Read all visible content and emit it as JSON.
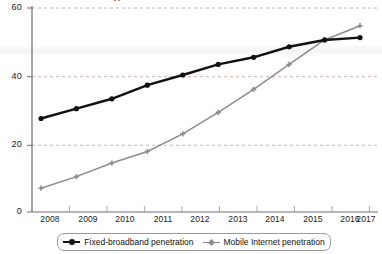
{
  "chart_data": {
    "type": "line",
    "title": "",
    "xlabel": "",
    "ylabel": "",
    "categories": [
      "2008",
      "2009",
      "2010",
      "2011",
      "2012",
      "2013",
      "2014",
      "2015",
      "2016",
      "2017"
    ],
    "x": [
      2008,
      2009,
      2010,
      2011,
      2012,
      2013,
      2014,
      2015,
      2016,
      2017
    ],
    "ylim": [
      0,
      60
    ],
    "xlim": [
      2008,
      2017
    ],
    "yticks": [
      0,
      20,
      40,
      60
    ],
    "ytick_labels": [
      "0",
      "20",
      "40",
      "60"
    ],
    "grid": "horizontal-dashed",
    "legend_position": "bottom-center",
    "series": [
      {
        "name": "Fixed-broadband penetration",
        "color": "#111111",
        "marker": "circle",
        "values": [
          27.5,
          30.4,
          33.3,
          37.3,
          40.3,
          43.4,
          45.5,
          48.6,
          50.6,
          51.3
        ]
      },
      {
        "name": "Mobile Internet penetration",
        "color": "#8c8c8c",
        "marker": "cross",
        "values": [
          7.0,
          10.4,
          14.4,
          17.8,
          23.0,
          29.3,
          36.1,
          43.4,
          50.6,
          54.8
        ]
      }
    ]
  },
  "axes": {
    "y_axis_name": "y-axis",
    "x_axis_name": "x-axis"
  },
  "legend": {
    "entries": [
      {
        "label": "Fixed-broadband penetration",
        "color": "#111111"
      },
      {
        "label": "Mobile Internet penetration",
        "color": "#8c8c8c"
      }
    ]
  },
  "artifacts": {
    "top_clipped_text": "Л"
  }
}
